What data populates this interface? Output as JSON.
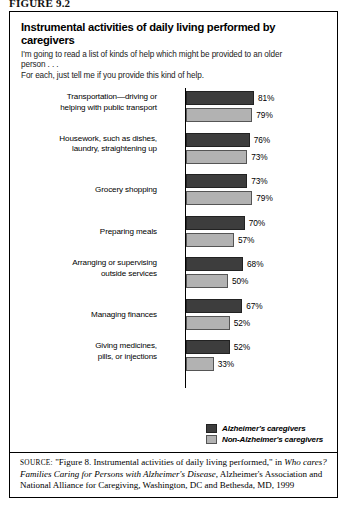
{
  "figure_label": "FIGURE 9.2",
  "header": {
    "title": "Instrumental activities of daily living performed by caregivers",
    "subtitle_line1": "I'm going to read a list of kinds of help which might be provided to an older",
    "subtitle_line2": "person . . .",
    "subtitle_line3": "For each, just tell me if you provide this kind of help."
  },
  "legend": {
    "alzheimers_label": "Alzheimer's caregivers",
    "non_alzheimers_label": "Non-Alzheimer's caregivers",
    "alzheimers_color": "#3d3d3d",
    "non_alzheimers_color": "#b2b2b2"
  },
  "source": {
    "keyword": "SOURCE:",
    "text_before_italic": " \"Figure 8. Instrumental activities of daily living performed,\" in ",
    "italic_title": "Who cares? Families Caring for Persons with Alzheimer's Disease",
    "text_after_italic": ", Alzheimer's Association and National Alliance for Caregiving, Washington, DC and Bethesda, MD, 1999"
  },
  "chart_data": {
    "type": "bar",
    "orientation": "horizontal",
    "title": "Instrumental activities of daily living performed by caregivers",
    "xlabel": "",
    "ylabel": "",
    "xlim": [
      0,
      100
    ],
    "grid": false,
    "legend_position": "bottom-right",
    "value_suffix": "%",
    "categories": [
      "Transportation—driving or helping with public transport",
      "Housework, such as dishes, laundry, straightening up",
      "Grocery shopping",
      "Preparing meals",
      "Arranging or supervising outside services",
      "Managing finances",
      "Giving medicines, pills, or injections"
    ],
    "category_lines": [
      [
        "Transportation—driving or",
        "helping with public transport"
      ],
      [
        "Housework, such as dishes,",
        "laundry, straightening up"
      ],
      [
        "Grocery shopping"
      ],
      [
        "Preparing meals"
      ],
      [
        "Arranging or supervising",
        "outside services"
      ],
      [
        "Managing finances"
      ],
      [
        "Giving medicines,",
        "pills, or injections"
      ]
    ],
    "series": [
      {
        "name": "Alzheimer's caregivers",
        "color": "#3d3d3d",
        "values": [
          81,
          76,
          73,
          70,
          68,
          67,
          52
        ],
        "labels": [
          "81%",
          "76%",
          "73%",
          "70%",
          "68%",
          "67%",
          "52%"
        ]
      },
      {
        "name": "Non-Alzheimer's caregivers",
        "color": "#b2b2b2",
        "values": [
          79,
          73,
          79,
          57,
          50,
          52,
          33
        ],
        "labels": [
          "79%",
          "73%",
          "79%",
          "57%",
          "50%",
          "52%",
          "33%"
        ]
      }
    ]
  }
}
